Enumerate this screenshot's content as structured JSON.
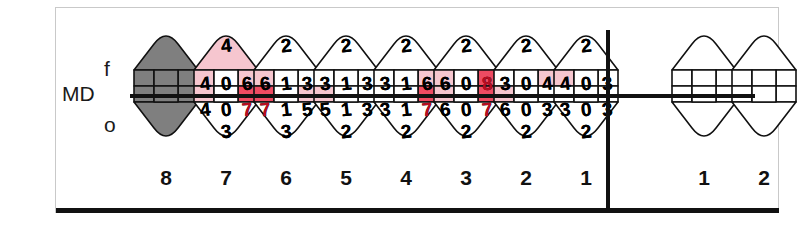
{
  "axis": {
    "facial": "f",
    "midline": "MD",
    "oral": "o"
  },
  "legend_colors": {
    "normal_fill": "#ffffff",
    "mild_fill": "#f6c6cf",
    "severe_fill": "#ee4b62",
    "missing_fill": "#7f7f7f",
    "outline": "#111111",
    "text": "#000000",
    "text_red": "#b80d22"
  },
  "chart_data": {
    "type": "table",
    "xlabel": "Tooth number",
    "ylabel": "Probing depth (mm)",
    "legend": [
      "normal (white)",
      "mild (light pink)",
      "severe (red)",
      "missing (gray)"
    ],
    "quadrants": [
      {
        "name": "left-quadrant",
        "teeth": [
          {
            "number": "8",
            "status": "missing",
            "values": {
              "facial_top": "",
              "facial_mesial": "",
              "facial_center": "",
              "facial_distal": "",
              "oral_mesial": "",
              "oral_center": "",
              "oral_distal": "",
              "oral_bottom": ""
            },
            "fills": {
              "facial_top": "missing",
              "facial_mesial": "missing",
              "facial_center": "missing",
              "facial_distal": "missing",
              "oral_mesial": "missing",
              "oral_center": "missing",
              "oral_distal": "missing",
              "oral_bottom": "missing"
            }
          },
          {
            "number": "7",
            "status": "charted",
            "values": {
              "facial_top": "4",
              "facial_mesial": "4",
              "facial_center": "0",
              "facial_distal": "6",
              "oral_mesial": "4",
              "oral_center": "0",
              "oral_distal": "7",
              "oral_bottom": "3"
            },
            "fills": {
              "facial_top": "mild",
              "facial_mesial": "mild",
              "facial_center": "normal",
              "facial_distal": "mild",
              "oral_mesial": "mild",
              "oral_center": "normal",
              "oral_distal": "severe",
              "oral_bottom": "normal"
            }
          },
          {
            "number": "6",
            "status": "charted",
            "values": {
              "facial_top": "2",
              "facial_mesial": "6",
              "facial_center": "1",
              "facial_distal": "3",
              "oral_mesial": "7",
              "oral_center": "1",
              "oral_distal": "5",
              "oral_bottom": "3"
            },
            "fills": {
              "facial_top": "normal",
              "facial_mesial": "mild",
              "facial_center": "normal",
              "facial_distal": "normal",
              "oral_mesial": "severe",
              "oral_center": "normal",
              "oral_distal": "mild",
              "oral_bottom": "normal"
            }
          },
          {
            "number": "5",
            "status": "charted",
            "values": {
              "facial_top": "2",
              "facial_mesial": "3",
              "facial_center": "1",
              "facial_distal": "3",
              "oral_mesial": "5",
              "oral_center": "1",
              "oral_distal": "3",
              "oral_bottom": "2"
            },
            "fills": {
              "facial_top": "normal",
              "facial_mesial": "normal",
              "facial_center": "normal",
              "facial_distal": "normal",
              "oral_mesial": "mild",
              "oral_center": "normal",
              "oral_distal": "normal",
              "oral_bottom": "normal"
            }
          },
          {
            "number": "4",
            "status": "charted",
            "values": {
              "facial_top": "2",
              "facial_mesial": "3",
              "facial_center": "1",
              "facial_distal": "6",
              "oral_mesial": "3",
              "oral_center": "1",
              "oral_distal": "7",
              "oral_bottom": "2"
            },
            "fills": {
              "facial_top": "normal",
              "facial_mesial": "normal",
              "facial_center": "normal",
              "facial_distal": "mild",
              "oral_mesial": "normal",
              "oral_center": "normal",
              "oral_distal": "severe",
              "oral_bottom": "normal"
            }
          },
          {
            "number": "3",
            "status": "charted",
            "values": {
              "facial_top": "2",
              "facial_mesial": "6",
              "facial_center": "0",
              "facial_distal": "8",
              "oral_mesial": "6",
              "oral_center": "0",
              "oral_distal": "7",
              "oral_bottom": "2"
            },
            "fills": {
              "facial_top": "normal",
              "facial_mesial": "mild",
              "facial_center": "normal",
              "facial_distal": "severe",
              "oral_mesial": "mild",
              "oral_center": "normal",
              "oral_distal": "severe",
              "oral_bottom": "normal"
            }
          },
          {
            "number": "2",
            "status": "charted",
            "values": {
              "facial_top": "2",
              "facial_mesial": "3",
              "facial_center": "0",
              "facial_distal": "4",
              "oral_mesial": "6",
              "oral_center": "0",
              "oral_distal": "3",
              "oral_bottom": "2"
            },
            "fills": {
              "facial_top": "normal",
              "facial_mesial": "normal",
              "facial_center": "normal",
              "facial_distal": "mild",
              "oral_mesial": "mild",
              "oral_center": "normal",
              "oral_distal": "normal",
              "oral_bottom": "normal"
            }
          },
          {
            "number": "1",
            "status": "charted",
            "values": {
              "facial_top": "2",
              "facial_mesial": "4",
              "facial_center": "0",
              "facial_distal": "3",
              "oral_mesial": "3",
              "oral_center": "0",
              "oral_distal": "3",
              "oral_bottom": "2"
            },
            "fills": {
              "facial_top": "normal",
              "facial_mesial": "mild",
              "facial_center": "normal",
              "facial_distal": "normal",
              "oral_mesial": "normal",
              "oral_center": "normal",
              "oral_distal": "normal",
              "oral_bottom": "normal"
            }
          }
        ]
      },
      {
        "name": "right-quadrant",
        "teeth": [
          {
            "number": "1",
            "status": "blank",
            "values": {
              "facial_top": "",
              "facial_mesial": "",
              "facial_center": "",
              "facial_distal": "",
              "oral_mesial": "",
              "oral_center": "",
              "oral_distal": "",
              "oral_bottom": ""
            },
            "fills": {
              "facial_top": "normal",
              "facial_mesial": "normal",
              "facial_center": "normal",
              "facial_distal": "normal",
              "oral_mesial": "normal",
              "oral_center": "normal",
              "oral_distal": "normal",
              "oral_bottom": "normal"
            }
          },
          {
            "number": "2",
            "status": "blank",
            "values": {
              "facial_top": "",
              "facial_mesial": "",
              "facial_center": "",
              "facial_distal": "",
              "oral_mesial": "",
              "oral_center": "",
              "oral_distal": "",
              "oral_bottom": ""
            },
            "fills": {
              "facial_top": "normal",
              "facial_mesial": "normal",
              "facial_center": "normal",
              "facial_distal": "normal",
              "oral_mesial": "normal",
              "oral_center": "normal",
              "oral_distal": "normal",
              "oral_bottom": "normal"
            }
          }
        ]
      }
    ]
  }
}
